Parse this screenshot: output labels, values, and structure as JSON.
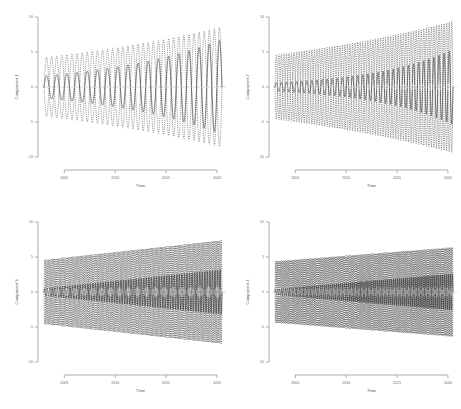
{
  "figure": {
    "type": "multi-panel-timeseries",
    "rows": 2,
    "cols": 2,
    "background": "#ffffff",
    "line_color": "#303030",
    "band_color": "#2b2b2b",
    "axis_color": "#8c8c8c"
  },
  "chart_data": [
    {
      "id": "panel1",
      "type": "line",
      "title": "",
      "xlabel": "Time",
      "ylabel": "Component 1",
      "xlim": [
        2003.0,
        2020.5
      ],
      "ylim": [
        -10,
        10
      ],
      "xticks": [
        2005,
        2010,
        2015,
        2020
      ],
      "xticklabels": [
        "2005",
        "2010",
        "2015",
        "2020"
      ],
      "yticks": [
        -10,
        -5,
        0,
        5,
        10
      ],
      "yticklabels": [
        "-10",
        "-5",
        "0",
        "5",
        "10"
      ],
      "grid": false,
      "legend": "none",
      "series": [
        {
          "name": "mean",
          "style": "solid",
          "frequency_cycles_per_year": 1.0,
          "amplitude_start": 1.6,
          "amplitude_end": 6.8,
          "amplitude_growth": "exponential"
        },
        {
          "name": "upper-band",
          "style": "dashed",
          "frequency_cycles_per_year": 1.0,
          "amplitude_start": 4.2,
          "amplitude_end": 8.6,
          "amplitude_growth": "exponential"
        },
        {
          "name": "lower-band",
          "style": "dashed",
          "frequency_cycles_per_year": 1.0,
          "amplitude_start": 4.2,
          "amplitude_end": 8.6,
          "amplitude_growth": "exponential"
        }
      ]
    },
    {
      "id": "panel2",
      "type": "line",
      "title": "",
      "xlabel": "Time",
      "ylabel": "Component 2",
      "xlim": [
        2003.0,
        2020.5
      ],
      "ylim": [
        -10,
        10
      ],
      "xticks": [
        2005,
        2010,
        2015,
        2020
      ],
      "xticklabels": [
        "2005",
        "2010",
        "2015",
        "2020"
      ],
      "yticks": [
        -10,
        -5,
        0,
        5,
        10
      ],
      "yticklabels": [
        "-10",
        "-5",
        "0",
        "5",
        "10"
      ],
      "grid": false,
      "legend": "none",
      "series": [
        {
          "name": "mean",
          "style": "solid",
          "frequency_cycles_per_year": 2.0,
          "amplitude_start": 0.6,
          "amplitude_end": 5.4,
          "amplitude_growth": "exponential"
        },
        {
          "name": "upper-band",
          "style": "dashed",
          "frequency_cycles_per_year": 2.0,
          "amplitude_start": 4.6,
          "amplitude_end": 9.4,
          "amplitude_growth": "exponential"
        },
        {
          "name": "lower-band",
          "style": "dashed",
          "frequency_cycles_per_year": 2.0,
          "amplitude_start": 4.6,
          "amplitude_end": 9.4,
          "amplitude_growth": "exponential"
        }
      ]
    },
    {
      "id": "panel3",
      "type": "line",
      "title": "",
      "xlabel": "Time",
      "ylabel": "Component 3",
      "xlim": [
        2003.0,
        2020.5
      ],
      "ylim": [
        -10,
        10
      ],
      "xticks": [
        2005,
        2010,
        2015,
        2020
      ],
      "xticklabels": [
        "2005",
        "2010",
        "2015",
        "2020"
      ],
      "yticks": [
        -10,
        -5,
        0,
        5,
        10
      ],
      "yticklabels": [
        "-10",
        "-5",
        "0",
        "5",
        "10"
      ],
      "grid": false,
      "legend": "none",
      "series": [
        {
          "name": "mean",
          "style": "solid",
          "frequency_cycles_per_year": 4.0,
          "amplitude_start": 0.5,
          "amplitude_end": 3.2,
          "amplitude_growth": "linear"
        },
        {
          "name": "upper-band",
          "style": "dashed",
          "frequency_cycles_per_year": 4.0,
          "amplitude_start": 4.6,
          "amplitude_end": 7.4,
          "amplitude_growth": "linear"
        },
        {
          "name": "lower-band",
          "style": "dashed",
          "frequency_cycles_per_year": 4.0,
          "amplitude_start": 4.6,
          "amplitude_end": 7.4,
          "amplitude_growth": "linear"
        }
      ]
    },
    {
      "id": "panel4",
      "type": "line",
      "title": "",
      "xlabel": "Time",
      "ylabel": "Component 4",
      "xlim": [
        2003.0,
        2020.5
      ],
      "ylim": [
        -10,
        10
      ],
      "xticks": [
        2005,
        2010,
        2015,
        2020
      ],
      "xticklabels": [
        "2005",
        "2010",
        "2015",
        "2020"
      ],
      "yticks": [
        -10,
        -5,
        0,
        5,
        10
      ],
      "yticklabels": [
        "-10",
        "-5",
        "0",
        "5",
        "10"
      ],
      "grid": false,
      "legend": "none",
      "series": [
        {
          "name": "mean",
          "style": "solid",
          "frequency_cycles_per_year": 5.0,
          "amplitude_start": 0.4,
          "amplitude_end": 2.6,
          "amplitude_growth": "linear"
        },
        {
          "name": "upper-band",
          "style": "dashed",
          "frequency_cycles_per_year": 5.0,
          "amplitude_start": 4.4,
          "amplitude_end": 6.4,
          "amplitude_growth": "linear"
        },
        {
          "name": "lower-band",
          "style": "dashed",
          "frequency_cycles_per_year": 5.0,
          "amplitude_start": 4.4,
          "amplitude_end": 6.4,
          "amplitude_growth": "linear"
        }
      ]
    }
  ]
}
